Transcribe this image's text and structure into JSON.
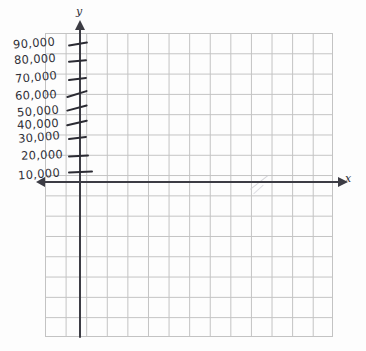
{
  "figure": {
    "kind": "hand-drawn-coordinate-grid",
    "paper": "graph-paper",
    "background_color": "#fdfdfd",
    "grid_line_color": "#b9b9b9",
    "ink_color": "#2f2f38"
  },
  "axes": {
    "y": {
      "letter": "y",
      "direction": "vertical",
      "arrow": "up",
      "tick_count": 9
    },
    "x": {
      "letter": "x",
      "direction": "horizontal",
      "arrow": "both",
      "tick_count": 0,
      "tick_labels": []
    }
  },
  "grid": {
    "columns": 14,
    "rows": 15,
    "cell_px": 20.5
  },
  "y_axis_labels": [
    {
      "text": "90,000",
      "value": 90000,
      "top": 36,
      "left": 13
    },
    {
      "text": "80,000",
      "value": 80000,
      "top": 52,
      "left": 14
    },
    {
      "text": "70,000",
      "value": 70000,
      "top": 70,
      "left": 15
    },
    {
      "text": "60,000",
      "value": 60000,
      "top": 88,
      "left": 15
    },
    {
      "text": "50,000",
      "value": 50000,
      "top": 104,
      "left": 17
    },
    {
      "text": "40,000",
      "value": 40000,
      "top": 117,
      "left": 17
    },
    {
      "text": "30,000",
      "value": 30000,
      "top": 130,
      "left": 18
    },
    {
      "text": "20,000",
      "value": 20000,
      "top": 148,
      "left": 21
    },
    {
      "text": "10,000",
      "value": 10000,
      "top": 167,
      "left": 18
    }
  ],
  "y_axis_ticks": [
    {
      "top": 43,
      "left": 68,
      "width": 20,
      "rotate": -9
    },
    {
      "top": 60,
      "left": 68,
      "width": 19,
      "rotate": -5
    },
    {
      "top": 78,
      "left": 68,
      "width": 19,
      "rotate": -7
    },
    {
      "top": 93,
      "left": 66,
      "width": 22,
      "rotate": -17
    },
    {
      "top": 107,
      "left": 66,
      "width": 22,
      "rotate": -15
    },
    {
      "top": 122,
      "left": 66,
      "width": 22,
      "rotate": -13
    },
    {
      "top": 137,
      "left": 68,
      "width": 19,
      "rotate": -7
    },
    {
      "top": 155,
      "left": 68,
      "width": 21,
      "rotate": -3
    },
    {
      "top": 171,
      "left": 68,
      "width": 25,
      "rotate": -2
    }
  ]
}
